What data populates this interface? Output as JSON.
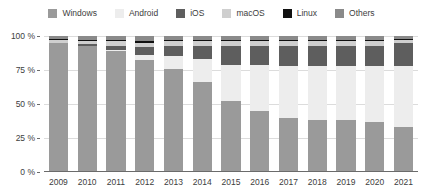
{
  "chart_data": {
    "type": "bar",
    "stacked": true,
    "title": "",
    "subtitle": "",
    "xlabel": "",
    "ylabel": "",
    "ylim": [
      0,
      100
    ],
    "yticks": [
      "0 %",
      "25 %",
      "50 %",
      "75 %",
      "100 %"
    ],
    "ytick_values": [
      0,
      25,
      50,
      75,
      100
    ],
    "grid": true,
    "legend_position": "top-center",
    "categories": [
      "2009",
      "2010",
      "2011",
      "2012",
      "2013",
      "2014",
      "2015",
      "2016",
      "2017",
      "2018",
      "2019",
      "2020",
      "2021"
    ],
    "series": [
      {
        "name": "Windows",
        "color": "#9a9a9a",
        "values": [
          95,
          93,
          89,
          82,
          76,
          66,
          52,
          45,
          40,
          38,
          38,
          37,
          33
        ]
      },
      {
        "name": "Android",
        "color": "#ededed",
        "values": [
          0,
          0,
          1,
          4,
          9,
          17,
          27,
          34,
          38,
          40,
          40,
          41,
          45
        ]
      },
      {
        "name": "iOS",
        "color": "#5e5e5e",
        "values": [
          0,
          1,
          3,
          6,
          8,
          10,
          14,
          14,
          15,
          15,
          15,
          15,
          17
        ]
      },
      {
        "name": "macOS",
        "color": "#cfcfcf",
        "values": [
          2,
          2,
          3,
          3,
          3,
          3,
          3,
          3,
          3,
          3,
          3,
          3,
          2
        ]
      },
      {
        "name": "Linux",
        "color": "#111111",
        "values": [
          1,
          1,
          1,
          1,
          1,
          1,
          1,
          1,
          1,
          1,
          1,
          1,
          1
        ]
      },
      {
        "name": "Others",
        "color": "#8a8a8a",
        "values": [
          2,
          3,
          3,
          4,
          3,
          3,
          3,
          3,
          3,
          3,
          3,
          3,
          2
        ]
      }
    ]
  },
  "legend": {
    "items": [
      {
        "label": "Windows",
        "color": "#9a9a9a"
      },
      {
        "label": "Android",
        "color": "#ededed"
      },
      {
        "label": "iOS",
        "color": "#5e5e5e"
      },
      {
        "label": "macOS",
        "color": "#cfcfcf"
      },
      {
        "label": "Linux",
        "color": "#111111"
      },
      {
        "label": "Others",
        "color": "#8a8a8a"
      }
    ]
  },
  "axes": {
    "y_tick_labels": [
      "100 %",
      "75 %",
      "50 %",
      "25 %",
      "0 %"
    ],
    "x_tick_labels": [
      "2009",
      "2010",
      "2011",
      "2012",
      "2013",
      "2014",
      "2015",
      "2016",
      "2017",
      "2018",
      "2019",
      "2020",
      "2021"
    ]
  },
  "style": {
    "background": "#ffffff",
    "grid_color": "#dcdcdc",
    "axis_color": "#6b6b6b",
    "text_color": "#3d3d3d"
  }
}
